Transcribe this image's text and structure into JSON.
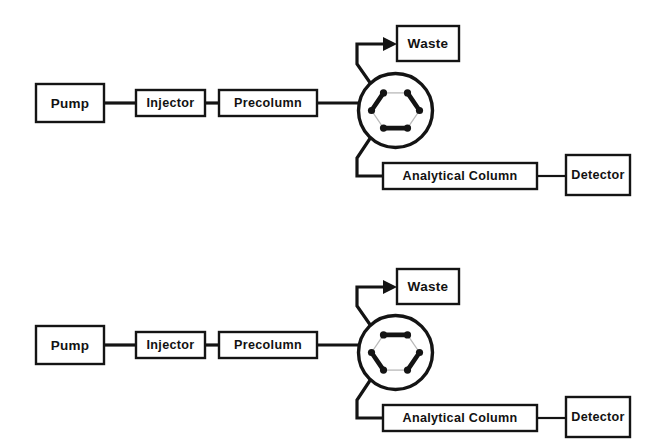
{
  "figure": {
    "background_color": "#ffffff",
    "line_color": "#141414",
    "inactive_port_color": "#b9b9b9"
  },
  "diagrams": [
    {
      "id": "top",
      "valve_position": "load",
      "boxes": {
        "pump": "Pump",
        "injector": "Injector",
        "precolumn": "Precolumn",
        "waste": "Waste",
        "analytical_column": "Analytical Column",
        "detector": "Detector"
      },
      "valve": {
        "ports": 6,
        "active_connections": [
          "upper-left-to-left",
          "upper-right-to-right",
          "lower-left-to-lower-right"
        ],
        "inactive_connections": [
          "upper-left-to-upper-right",
          "left-to-lower-left",
          "right-to-lower-right"
        ]
      }
    },
    {
      "id": "bottom",
      "valve_position": "inject",
      "boxes": {
        "pump": "Pump",
        "injector": "Injector",
        "precolumn": "Precolumn",
        "waste": "Waste",
        "analytical_column": "Analytical Column",
        "detector": "Detector"
      },
      "valve": {
        "ports": 6,
        "active_connections": [
          "upper-left-to-upper-right",
          "left-to-lower-left",
          "right-to-lower-right"
        ],
        "inactive_connections": [
          "upper-left-to-left",
          "upper-right-to-right",
          "lower-left-to-lower-right"
        ]
      }
    }
  ]
}
